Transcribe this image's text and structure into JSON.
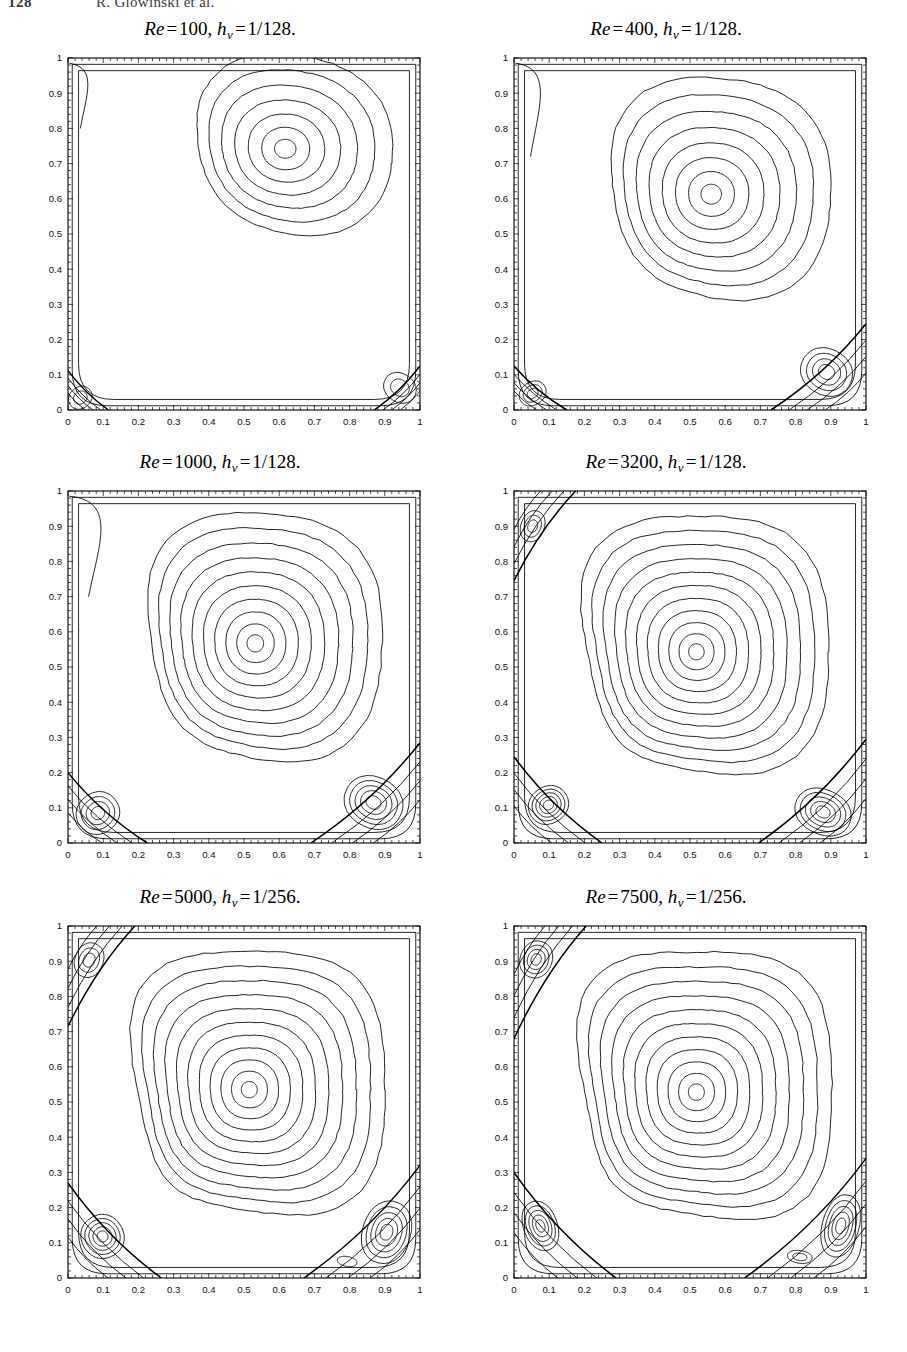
{
  "running_head": {
    "folio": "128",
    "authors": "R. Glowinski et al."
  },
  "figure": {
    "caption": "",
    "panel_count": 6
  },
  "axes": {
    "x_ticks": [
      "0",
      "0.1",
      "0.2",
      "0.3",
      "0.4",
      "0.5",
      "0.6",
      "0.7",
      "0.8",
      "0.9",
      "1"
    ],
    "y_ticks": [
      "0",
      "0.1",
      "0.2",
      "0.3",
      "0.4",
      "0.5",
      "0.6",
      "0.7",
      "0.8",
      "0.9",
      "1"
    ],
    "xlim": [
      0,
      1
    ],
    "ylim": [
      0,
      1
    ],
    "xlabel": "",
    "ylabel": "",
    "grid": false,
    "tick_direction": "in",
    "line_color": "#000000"
  },
  "chart_data": {
    "type": "line",
    "xlabel": "x",
    "ylabel": "y",
    "xlim": [
      0,
      1
    ],
    "ylim": [
      0,
      1
    ],
    "grid": false,
    "legend": "none",
    "panels": [
      {
        "id": "re100",
        "title_reynolds_label": "Re",
        "title_reynolds_value": "100",
        "title_mesh_label": "h",
        "title_mesh_sub": "v",
        "title_mesh_value": "1/128",
        "title_plain": "Re = 100, h_v = 1/128.",
        "reynolds": 100,
        "mesh_size": "1/128",
        "primary_vortex": {
          "cx": 0.617,
          "cy": 0.742,
          "rings": 7,
          "rx": 0.305,
          "ry": 0.268,
          "rot": -8,
          "squareness": 2.3
        },
        "secondary_vortices": [
          {
            "name": "bottom-left",
            "cx": 0.035,
            "cy": 0.035,
            "rx": 0.035,
            "ry": 0.03,
            "rings": 2,
            "rot": 40
          },
          {
            "name": "bottom-right",
            "cx": 0.943,
            "cy": 0.063,
            "rx": 0.048,
            "ry": 0.04,
            "rings": 2,
            "rot": -35
          }
        ],
        "separatrices": [
          {
            "name": "bottom-left-sep",
            "corner": "bl",
            "ext_x": 0.115,
            "ext_y": 0.112
          },
          {
            "name": "bottom-right-sep",
            "corner": "br",
            "ext_x": 0.13,
            "ext_y": 0.125
          }
        ],
        "top_left_jet": {
          "present": true,
          "depth": 0.045,
          "y_top": 0.985,
          "y_bot": 0.8
        }
      },
      {
        "id": "re400",
        "title_reynolds_label": "Re",
        "title_reynolds_value": "400",
        "title_mesh_label": "h",
        "title_mesh_sub": "v",
        "title_mesh_value": "1/128",
        "title_plain": "Re = 400, h_v = 1/128.",
        "reynolds": 400,
        "mesh_size": "1/128",
        "primary_vortex": {
          "cx": 0.56,
          "cy": 0.613,
          "rings": 8,
          "rx": 0.34,
          "ry": 0.33,
          "rot": -5,
          "squareness": 2.5
        },
        "secondary_vortices": [
          {
            "name": "bottom-left",
            "cx": 0.053,
            "cy": 0.047,
            "rx": 0.04,
            "ry": 0.032,
            "rings": 3,
            "rot": 35
          },
          {
            "name": "bottom-right",
            "cx": 0.888,
            "cy": 0.108,
            "rx": 0.075,
            "ry": 0.065,
            "rings": 4,
            "rot": -30
          }
        ],
        "separatrices": [
          {
            "name": "bottom-left-sep",
            "corner": "bl",
            "ext_x": 0.15,
            "ext_y": 0.125
          },
          {
            "name": "bottom-right-sep",
            "corner": "br",
            "ext_x": 0.27,
            "ext_y": 0.245
          }
        ],
        "top_left_jet": {
          "present": true,
          "depth": 0.06,
          "y_top": 0.985,
          "y_bot": 0.72
        }
      },
      {
        "id": "re1000",
        "title_reynolds_label": "Re",
        "title_reynolds_value": "1000",
        "title_mesh_label": "h",
        "title_mesh_sub": "v",
        "title_mesh_value": "1/128",
        "title_plain": "Re = 1000, h_v = 1/128.",
        "reynolds": 1000,
        "mesh_size": "1/128",
        "primary_vortex": {
          "cx": 0.532,
          "cy": 0.567,
          "rings": 10,
          "rx": 0.36,
          "ry": 0.37,
          "rot": -3,
          "squareness": 2.7
        },
        "secondary_vortices": [
          {
            "name": "bottom-left",
            "cx": 0.085,
            "cy": 0.085,
            "rx": 0.062,
            "ry": 0.058,
            "rings": 4,
            "rot": 38
          },
          {
            "name": "bottom-right",
            "cx": 0.868,
            "cy": 0.115,
            "rx": 0.085,
            "ry": 0.072,
            "rings": 5,
            "rot": -28
          }
        ],
        "separatrices": [
          {
            "name": "bottom-left-sep",
            "corner": "bl",
            "ext_x": 0.225,
            "ext_y": 0.2
          },
          {
            "name": "bottom-right-sep",
            "corner": "br",
            "ext_x": 0.31,
            "ext_y": 0.285
          }
        ],
        "top_left_jet": {
          "present": true,
          "depth": 0.075,
          "y_top": 0.985,
          "y_bot": 0.7
        }
      },
      {
        "id": "re3200",
        "title_reynolds_label": "Re",
        "title_reynolds_value": "3200",
        "title_mesh_label": "h",
        "title_mesh_sub": "v",
        "title_mesh_value": "1/128",
        "title_plain": "Re = 3200, h_v = 1/128.",
        "reynolds": 3200,
        "mesh_size": "1/128",
        "primary_vortex": {
          "cx": 0.518,
          "cy": 0.543,
          "rings": 11,
          "rx": 0.375,
          "ry": 0.385,
          "rot": 0,
          "squareness": 3.0
        },
        "secondary_vortices": [
          {
            "name": "top-left",
            "cx": 0.053,
            "cy": 0.9,
            "rx": 0.033,
            "ry": 0.045,
            "rings": 3,
            "rot": -20
          },
          {
            "name": "bottom-left",
            "cx": 0.098,
            "cy": 0.108,
            "rx": 0.058,
            "ry": 0.052,
            "rings": 5,
            "rot": 35
          },
          {
            "name": "bottom-right",
            "cx": 0.878,
            "cy": 0.088,
            "rx": 0.082,
            "ry": 0.063,
            "rings": 5,
            "rot": -25
          }
        ],
        "separatrices": [
          {
            "name": "top-left-sep",
            "corner": "tl",
            "ext_x": 0.175,
            "ext_y": 0.255
          },
          {
            "name": "bottom-left-sep",
            "corner": "bl",
            "ext_x": 0.25,
            "ext_y": 0.245
          },
          {
            "name": "bottom-right-sep",
            "corner": "br",
            "ext_x": 0.305,
            "ext_y": 0.295
          }
        ],
        "top_left_jet": {
          "present": false,
          "depth": 0.0,
          "y_top": 0.985,
          "y_bot": 0.75
        }
      },
      {
        "id": "re5000",
        "title_reynolds_label": "Re",
        "title_reynolds_value": "5000",
        "title_mesh_label": "h",
        "title_mesh_sub": "v",
        "title_mesh_value": "1/256",
        "title_plain": "Re = 5000, h_v = 1/256.",
        "reynolds": 5000,
        "mesh_size": "1/256",
        "primary_vortex": {
          "cx": 0.515,
          "cy": 0.535,
          "rings": 11,
          "rx": 0.385,
          "ry": 0.392,
          "rot": 0,
          "squareness": 3.2
        },
        "secondary_vortices": [
          {
            "name": "top-left",
            "cx": 0.06,
            "cy": 0.903,
            "rx": 0.04,
            "ry": 0.05,
            "rings": 3,
            "rot": -22
          },
          {
            "name": "bottom-left",
            "cx": 0.098,
            "cy": 0.118,
            "rx": 0.06,
            "ry": 0.062,
            "rings": 5,
            "rot": 32
          },
          {
            "name": "bottom-right",
            "cx": 0.905,
            "cy": 0.13,
            "rx": 0.068,
            "ry": 0.09,
            "rings": 5,
            "rot": -18
          },
          {
            "name": "bottom-tertiary",
            "cx": 0.793,
            "cy": 0.047,
            "rx": 0.028,
            "ry": 0.014,
            "rings": 1,
            "rot": -10
          }
        ],
        "separatrices": [
          {
            "name": "top-left-sep",
            "corner": "tl",
            "ext_x": 0.19,
            "ext_y": 0.285
          },
          {
            "name": "bottom-left-sep",
            "corner": "bl",
            "ext_x": 0.265,
            "ext_y": 0.27
          },
          {
            "name": "bottom-right-sep",
            "corner": "br",
            "ext_x": 0.33,
            "ext_y": 0.32
          }
        ],
        "top_left_jet": {
          "present": false,
          "depth": 0.0,
          "y_top": 0.985,
          "y_bot": 0.75
        }
      },
      {
        "id": "re7500",
        "title_reynolds_label": "Re",
        "title_reynolds_value": "7500",
        "title_mesh_label": "h",
        "title_mesh_sub": "v",
        "title_mesh_value": "1/256",
        "title_plain": "Re = 7500, h_v = 1/256.",
        "reynolds": 7500,
        "mesh_size": "1/256",
        "primary_vortex": {
          "cx": 0.518,
          "cy": 0.528,
          "rings": 11,
          "rx": 0.385,
          "ry": 0.398,
          "rot": 0,
          "squareness": 3.3
        },
        "secondary_vortices": [
          {
            "name": "top-left",
            "cx": 0.063,
            "cy": 0.905,
            "rx": 0.045,
            "ry": 0.053,
            "rings": 4,
            "rot": -22
          },
          {
            "name": "bottom-left",
            "cx": 0.075,
            "cy": 0.148,
            "rx": 0.048,
            "ry": 0.072,
            "rings": 5,
            "rot": 20
          },
          {
            "name": "bottom-right",
            "cx": 0.928,
            "cy": 0.148,
            "rx": 0.052,
            "ry": 0.09,
            "rings": 5,
            "rot": -15
          },
          {
            "name": "bottom-tertiary",
            "cx": 0.812,
            "cy": 0.06,
            "rx": 0.035,
            "ry": 0.018,
            "rings": 2,
            "rot": -8
          }
        ],
        "separatrices": [
          {
            "name": "top-left-sep",
            "corner": "tl",
            "ext_x": 0.205,
            "ext_y": 0.32
          },
          {
            "name": "bottom-left-sep",
            "corner": "bl",
            "ext_x": 0.29,
            "ext_y": 0.3
          },
          {
            "name": "bottom-right-sep",
            "corner": "br",
            "ext_x": 0.345,
            "ext_y": 0.34
          }
        ],
        "top_left_jet": {
          "present": false,
          "depth": 0.0,
          "y_top": 0.985,
          "y_bot": 0.75
        }
      }
    ]
  }
}
